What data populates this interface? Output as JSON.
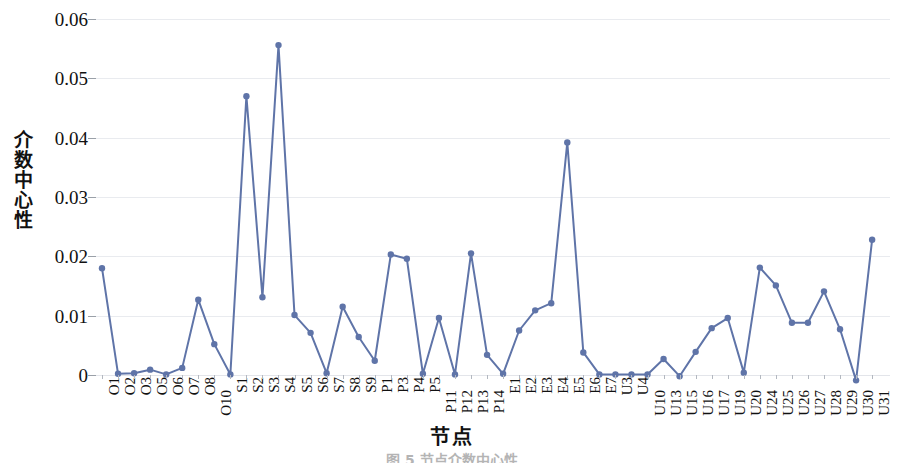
{
  "figure": {
    "caption": "图 5    节点介数中心性"
  },
  "chart_data": {
    "type": "line",
    "title": "",
    "xlabel": "节点",
    "ylabel": "介数中心性",
    "ylim": [
      0,
      0.06
    ],
    "ytick_values": [
      0,
      0.01,
      0.02,
      0.03,
      0.04,
      0.05,
      0.06
    ],
    "ytick_labels": [
      "0",
      "0.01",
      "0.02",
      "0.03",
      "0.04",
      "0.05",
      "0.06"
    ],
    "grid": true,
    "legend": "none",
    "marker": "circle",
    "line_color": "#5F74A8",
    "marker_color": "#5F74A8",
    "gridline_color": "#E9EBEF",
    "categories": [
      "O1",
      "O2",
      "O3",
      "O5",
      "O6",
      "O7",
      "O8",
      "O10",
      "S1",
      "S2",
      "S3",
      "S4",
      "S5",
      "S6",
      "S7",
      "S8",
      "S9",
      "P1",
      "P3",
      "P4",
      "P5",
      "P11",
      "P12",
      "P13",
      "P14",
      "E1",
      "E2",
      "E3",
      "E4",
      "E5",
      "E6",
      "E7",
      "U3",
      "U4",
      "U10",
      "U13",
      "U15",
      "U16",
      "U17",
      "U19",
      "U20",
      "U24",
      "U25",
      "U26",
      "U27",
      "U28",
      "U29",
      "U30",
      "U31"
    ],
    "values": [
      0.018,
      0.0002,
      0.0003,
      0.0009,
      0.0001,
      0.0012,
      0.0127,
      0.0052,
      0.0001,
      0.047,
      0.0131,
      0.0556,
      0.0101,
      0.0071,
      0.0003,
      0.0115,
      0.0064,
      0.0024,
      0.0203,
      0.0196,
      0.0002,
      0.0096,
      0.0001,
      0.0205,
      0.0034,
      0.0002,
      0.0075,
      0.0109,
      0.0121,
      0.0392,
      0.0038,
      0.0001,
      0.0001,
      0.0001,
      0.0001,
      0.0027,
      -0.0002,
      0.0039,
      0.0079,
      0.0096,
      0.0004,
      0.0181,
      0.0151,
      0.0088,
      0.0088,
      0.0141,
      0.0077,
      -0.0009,
      0.0228
    ]
  }
}
